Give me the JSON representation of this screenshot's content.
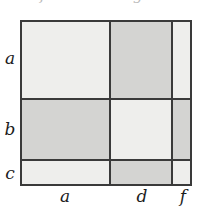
{
  "figure": {
    "type": "grid-matrix-diagram",
    "width": 213,
    "height": 208,
    "background_color": "#ffffff",
    "border_color": "#3a3a3a"
  },
  "top_annotations": {
    "note": "two faint italic letters clipped by the top edge of the image",
    "items": [
      {
        "text": "f",
        "x": 40
      },
      {
        "text": "g",
        "x": 133
      }
    ]
  },
  "grid": {
    "row_labels": [
      "a",
      "b",
      "c"
    ],
    "col_labels": [
      "a",
      "d",
      "f"
    ],
    "row_heights": [
      78,
      62,
      24
    ],
    "col_widths": [
      88,
      62,
      18
    ],
    "shade_colors": {
      "light": "#eeeeec",
      "dark": "#d4d4d2"
    },
    "cells": [
      [
        {
          "row": "a",
          "col": "a",
          "shade": "light"
        },
        {
          "row": "a",
          "col": "d",
          "shade": "dark"
        },
        {
          "row": "a",
          "col": "f",
          "shade": "light"
        }
      ],
      [
        {
          "row": "b",
          "col": "a",
          "shade": "dark"
        },
        {
          "row": "b",
          "col": "d",
          "shade": "light"
        },
        {
          "row": "b",
          "col": "f",
          "shade": "dark"
        }
      ],
      [
        {
          "row": "c",
          "col": "a",
          "shade": "light"
        },
        {
          "row": "c",
          "col": "d",
          "shade": "dark"
        },
        {
          "row": "c",
          "col": "f",
          "shade": "light"
        }
      ]
    ]
  }
}
